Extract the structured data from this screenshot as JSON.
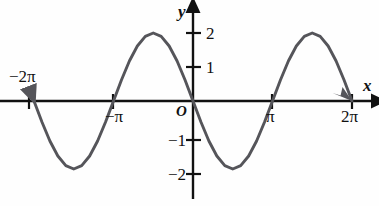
{
  "figure": {
    "kind": "cartesian-plot",
    "background_color": "#fefefe",
    "axis_color": "#111111",
    "curve_color": "#55555a"
  },
  "axes": {
    "x_label": "x",
    "y_label": "y",
    "origin_label": "O",
    "x_ticks": [
      {
        "value": "-2π",
        "label": "−2π",
        "x_px": 29,
        "label_side": "above"
      },
      {
        "value": "-π",
        "label": "−π",
        "x_px": 113,
        "label_side": "below"
      },
      {
        "value": "π",
        "label": "π",
        "x_px": 272,
        "label_side": "below"
      },
      {
        "value": "2π",
        "label": "2π",
        "x_px": 352,
        "label_side": "below"
      }
    ],
    "y_ticks": [
      {
        "value": 2,
        "label": "2",
        "y_px": 33,
        "label_side": "right"
      },
      {
        "value": 1,
        "label": "1",
        "y_px": 67,
        "label_side": "right"
      },
      {
        "value": -1,
        "label": "−1",
        "y_px": 140,
        "label_side": "left"
      },
      {
        "value": -2,
        "label": "−2",
        "y_px": 174,
        "label_side": "left"
      }
    ],
    "x_range": [
      -2.35,
      2.35
    ],
    "y_range": [
      -2.9,
      2.9
    ],
    "grid": false,
    "arrow_x_positive": true,
    "arrow_y_positive": true
  },
  "chart_data": {
    "type": "line",
    "title": "",
    "xlabel": "x",
    "ylabel": "y",
    "equation": "y = -2 sin(x)",
    "amplitude": 2,
    "period": "2π",
    "xlim": [
      "-2π",
      "2π"
    ],
    "ylim": [
      -2.9,
      2.9
    ],
    "grid": false,
    "legend": "none",
    "endpoint_arrows": [
      "-2π",
      "2π"
    ],
    "x_tick_labels": [
      "−2π",
      "−π",
      "π",
      "2π"
    ],
    "y_tick_labels": [
      "2",
      "1",
      "−1",
      "−2"
    ],
    "key_points": [
      {
        "x": "-2π",
        "y": 0,
        "kind": "zero-crossing-endpoint"
      },
      {
        "x": "-3π/2",
        "y": -2,
        "kind": "minimum"
      },
      {
        "x": "-π",
        "y": 0,
        "kind": "zero-crossing"
      },
      {
        "x": "-π/2",
        "y": 2,
        "kind": "maximum"
      },
      {
        "x": "0",
        "y": 0,
        "kind": "zero-crossing"
      },
      {
        "x": "π/2",
        "y": -2,
        "kind": "minimum"
      },
      {
        "x": "π",
        "y": 0,
        "kind": "zero-crossing"
      },
      {
        "x": "3π/2",
        "y": 2,
        "kind": "maximum"
      },
      {
        "x": "2π",
        "y": 0,
        "kind": "zero-crossing-endpoint"
      }
    ],
    "series": [
      {
        "name": "y = -2 sin(x)",
        "x": [
          -2.0,
          -1.9,
          -1.8,
          -1.7,
          -1.6,
          -1.5,
          -1.4,
          -1.3,
          -1.2,
          -1.1,
          -1.0,
          -0.9,
          -0.8,
          -0.7,
          -0.6,
          -0.5,
          -0.4,
          -0.3,
          -0.2,
          -0.1,
          0.0,
          0.1,
          0.2,
          0.3,
          0.4,
          0.5,
          0.6,
          0.7,
          0.8,
          0.9,
          1.0,
          1.1,
          1.2,
          1.3,
          1.4,
          1.5,
          1.6,
          1.7,
          1.8,
          1.9,
          2.0
        ],
        "x_unit": "π",
        "values": [
          0.0,
          -0.618,
          -1.176,
          -1.618,
          -1.902,
          -2.0,
          -1.902,
          -1.618,
          -1.176,
          -0.618,
          0.0,
          0.618,
          1.176,
          1.618,
          1.902,
          2.0,
          1.902,
          1.618,
          1.176,
          0.618,
          0.0,
          -0.618,
          -1.176,
          -1.618,
          -1.902,
          -2.0,
          -1.902,
          -1.618,
          -1.176,
          -0.618,
          0.0,
          0.618,
          1.176,
          1.618,
          1.902,
          2.0,
          1.902,
          1.618,
          1.176,
          0.618,
          0.0
        ]
      }
    ]
  }
}
